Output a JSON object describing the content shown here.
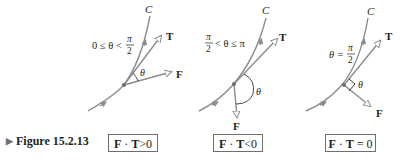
{
  "figure": {
    "caption": "Figure 15.2.13",
    "caption_marker": "▶",
    "colors": {
      "curve": "#8a8c8e",
      "text": "#231f20",
      "box_border": "#6d6e71",
      "background": "#ffffff"
    },
    "panels": [
      {
        "id": "acute",
        "curve_label": "C",
        "tangent_label": "T",
        "force_label": "F",
        "angle_label": "θ",
        "condition_lhs": "0 ≤ θ <",
        "condition_frac_num": "π",
        "condition_frac_den": "2",
        "result_lhs_F": "F",
        "result_dot": "·",
        "result_lhs_T": "T",
        "result_rel": ">",
        "result_rhs": "0"
      },
      {
        "id": "obtuse",
        "curve_label": "C",
        "tangent_label": "T",
        "force_label": "F",
        "angle_label": "θ",
        "condition_frac_num": "π",
        "condition_frac_den": "2",
        "condition_rhs": "< θ ≤ π",
        "result_lhs_F": "F",
        "result_dot": "·",
        "result_lhs_T": "T",
        "result_rel": "<",
        "result_rhs": "0"
      },
      {
        "id": "right",
        "curve_label": "C",
        "tangent_label": "T",
        "force_label": "F",
        "angle_label": "θ",
        "condition_lhs": "θ =",
        "condition_frac_num": "π",
        "condition_frac_den": "2",
        "result_lhs_F": "F",
        "result_dot": "·",
        "result_lhs_T": "T",
        "result_rel": "=",
        "result_rhs": "0"
      }
    ]
  }
}
